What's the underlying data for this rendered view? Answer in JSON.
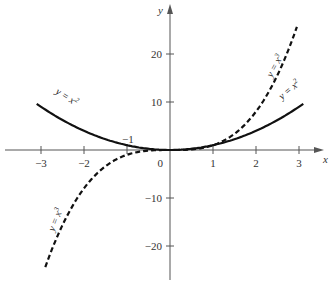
{
  "chart_data": {
    "type": "line",
    "title": "",
    "xlabel": "x",
    "ylabel": "y",
    "xlim": [
      -3.2,
      3.3
    ],
    "ylim": [
      -25,
      27
    ],
    "grid": false,
    "x_ticks": [
      -3,
      -2,
      -1,
      0,
      1,
      2,
      3
    ],
    "x_tick_labels": [
      "−3",
      "−2",
      "",
      "0",
      "1",
      "2",
      "3"
    ],
    "y_ticks": [
      -20,
      -10,
      10,
      20
    ],
    "y_tick_labels": [
      "−20",
      "−10",
      "10",
      "20"
    ],
    "annotations": [
      {
        "text": "−1",
        "x": -1,
        "y": 1
      }
    ],
    "series": [
      {
        "name": "y = x²",
        "style": "solid",
        "x": [
          -3.1,
          -2,
          -1,
          0,
          1,
          2,
          3.1
        ],
        "values": [
          9.61,
          4,
          1,
          0,
          1,
          4,
          9.61
        ]
      },
      {
        "name": "y = x³",
        "style": "dashed",
        "x": [
          -2.9,
          -2,
          -1,
          0,
          1,
          2,
          2.95
        ],
        "values": [
          -24.4,
          -8,
          -1,
          0,
          1,
          8,
          25.7
        ]
      }
    ],
    "legend": "inline labels along curves"
  },
  "labels": {
    "x_axis": "x",
    "y_axis": "y",
    "parabola": "y = x",
    "parabola_exp": "2",
    "cubic": "y = x",
    "cubic_exp": "3",
    "minus_one": "−1",
    "origin": "0"
  }
}
